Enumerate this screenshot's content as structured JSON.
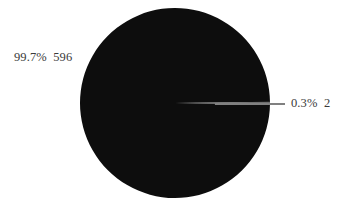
{
  "chart_data": {
    "type": "pie",
    "title": "",
    "subtitle": "",
    "xlabel": "",
    "ylabel": "",
    "grid": false,
    "legend": "none",
    "label_format": "percent + count",
    "total": 598,
    "categories": [
      "596",
      "2"
    ],
    "values": [
      596,
      2
    ],
    "percents": [
      99.7,
      0.3
    ],
    "slices": [
      {
        "percent_label": "99.7%",
        "value_label": "596",
        "full_label": "99.7%  596",
        "percent": 99.7,
        "value": 596,
        "color": "#0d0d0d",
        "label_position": "outside-upper-left",
        "has_leader_line": false
      },
      {
        "percent_label": "0.3%",
        "value_label": "2",
        "full_label": "0.3%  2",
        "percent": 0.3,
        "value": 2,
        "color": "#6e6e6e",
        "label_position": "outside-right",
        "has_leader_line": true
      }
    ],
    "colors": {
      "background": "#ffffff",
      "slice_major": "#0d0d0d",
      "slice_minor": "#6e6e6e",
      "leader_line": "#808080",
      "label_text": "#3a3a3a"
    },
    "geometry": {
      "center_x": 175,
      "center_y": 103,
      "radius": 95,
      "start_angle_deg": 0,
      "direction": "clockwise"
    }
  },
  "labels": {
    "major": "99.7%  596",
    "minor": "0.3%  2"
  }
}
